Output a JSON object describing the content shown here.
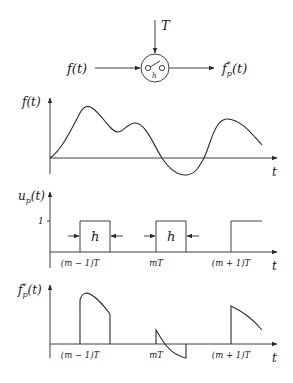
{
  "block": {
    "input_label": "f(t)",
    "output_label_base": "f",
    "output_label_sup": "*",
    "output_label_sub": "p",
    "output_label_arg": "(t)",
    "period_label": "T",
    "switch_label": "h"
  },
  "plot_f": {
    "ylabel": "f(t)",
    "xlabel": "t"
  },
  "plot_u": {
    "ylabel_base": "u",
    "ylabel_sub": "p",
    "ylabel_arg": "(t)",
    "xlabel": "t",
    "level_label": "1",
    "width_label_1": "h",
    "width_label_2": "h",
    "ticks": [
      "(m − 1)T",
      "mT",
      "(m + 1)T"
    ]
  },
  "plot_fp": {
    "ylabel_base": "f",
    "ylabel_sup": "*",
    "ylabel_sub": "p",
    "ylabel_arg": "(t)",
    "xlabel": "t",
    "ticks": [
      "(m − 1)T",
      "mT",
      "(m + 1)T"
    ]
  },
  "colors": {
    "ink": "#2a2a2a",
    "background": "#ffffff"
  }
}
